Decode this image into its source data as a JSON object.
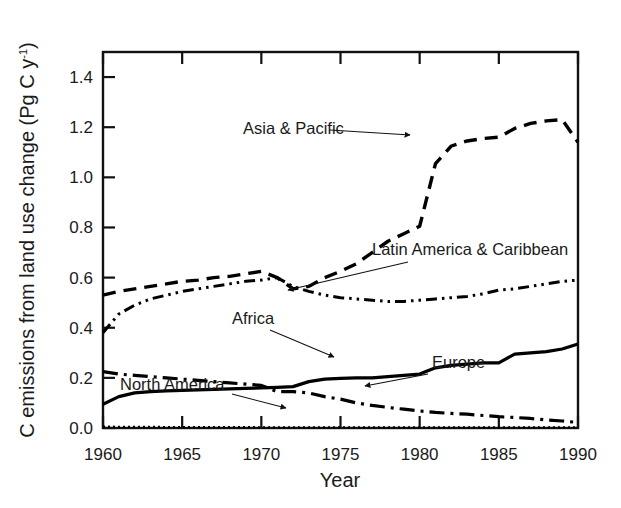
{
  "chart_data": {
    "type": "line",
    "title": "",
    "xlabel": "Year",
    "ylabel": "C emissions from land use change (Pg C y-1)",
    "ylabel_parts": {
      "main": "C emissions from land use change (Pg C y",
      "superscript": "-1",
      "tail": ")"
    },
    "xlim": [
      1960,
      1990
    ],
    "ylim": [
      0.0,
      1.5
    ],
    "grid": false,
    "legend_position": "inline-annotations",
    "xticks": [
      1960,
      1965,
      1970,
      1975,
      1980,
      1985,
      1990
    ],
    "xticklabels": [
      "1960",
      "1965",
      "1970",
      "1975",
      "1980",
      "1985",
      "1990"
    ],
    "yticks": [
      0.0,
      0.2,
      0.4,
      0.6,
      0.8,
      1.0,
      1.2,
      1.4
    ],
    "yticklabels": [
      "0.0",
      "0.2",
      "0.4",
      "0.6",
      "0.8",
      "1.0",
      "1.2",
      "1.4"
    ],
    "x": [
      1960,
      1961,
      1962,
      1963,
      1964,
      1965,
      1966,
      1967,
      1968,
      1969,
      1970,
      1971,
      1972,
      1973,
      1974,
      1975,
      1976,
      1977,
      1978,
      1979,
      1980,
      1981,
      1982,
      1983,
      1984,
      1985,
      1986,
      1987,
      1988,
      1989,
      1990
    ],
    "series": [
      {
        "name": "Asia & Pacific",
        "linestyle": "dashed",
        "color": "#000000",
        "values": [
          0.53,
          0.545,
          0.555,
          0.565,
          0.575,
          0.585,
          0.59,
          0.6,
          0.605,
          0.615,
          0.625,
          0.6,
          0.555,
          0.565,
          0.6,
          0.625,
          0.655,
          0.7,
          0.745,
          0.775,
          0.805,
          1.055,
          1.125,
          1.145,
          1.155,
          1.16,
          1.195,
          1.215,
          1.225,
          1.23,
          1.14
        ]
      },
      {
        "name": "Latin America &  Caribbean",
        "linestyle": "dashdotdot",
        "color": "#000000",
        "values": [
          0.38,
          0.455,
          0.49,
          0.515,
          0.53,
          0.545,
          0.555,
          0.565,
          0.575,
          0.585,
          0.59,
          0.6,
          0.565,
          0.545,
          0.53,
          0.52,
          0.515,
          0.51,
          0.505,
          0.505,
          0.51,
          0.515,
          0.52,
          0.525,
          0.535,
          0.55,
          0.555,
          0.565,
          0.575,
          0.585,
          0.59
        ]
      },
      {
        "name": "Africa",
        "linestyle": "solid",
        "color": "#000000",
        "values": [
          0.095,
          0.125,
          0.14,
          0.145,
          0.148,
          0.15,
          0.152,
          0.154,
          0.156,
          0.158,
          0.16,
          0.162,
          0.165,
          0.185,
          0.195,
          0.198,
          0.2,
          0.2,
          0.205,
          0.21,
          0.215,
          0.24,
          0.25,
          0.255,
          0.26,
          0.26,
          0.295,
          0.3,
          0.305,
          0.315,
          0.335
        ]
      },
      {
        "name": "Europe",
        "linestyle": "dashdot",
        "color": "#000000",
        "values": [
          0.225,
          0.215,
          0.21,
          0.205,
          0.2,
          0.195,
          0.19,
          0.185,
          0.18,
          0.175,
          0.17,
          0.145,
          0.145,
          0.14,
          0.125,
          0.115,
          0.1,
          0.09,
          0.082,
          0.075,
          0.068,
          0.062,
          0.058,
          0.055,
          0.05,
          0.045,
          0.042,
          0.038,
          0.032,
          0.028,
          0.022
        ]
      },
      {
        "name": "North America",
        "linestyle": "dotted",
        "color": "#000000",
        "values": [
          0.005,
          0.004,
          0.004,
          0.004,
          0.003,
          0.003,
          0.003,
          0.003,
          0.003,
          0.003,
          0.002,
          0.002,
          0.002,
          0.002,
          0.002,
          0.002,
          0.002,
          0.002,
          0.002,
          0.002,
          0.002,
          0.002,
          0.002,
          0.002,
          0.002,
          0.002,
          0.002,
          0.002,
          0.002,
          0.002,
          0.002
        ]
      }
    ],
    "annotations": [
      {
        "text": "Asia & Pacific",
        "label_x": 243,
        "label_y": 134,
        "leader_from": [
          330,
          130
        ],
        "leader_to": [
          410,
          135
        ]
      },
      {
        "text": "Latin America &  Caribbean",
        "label_x": 372,
        "label_y": 255,
        "leader_from": [
          408,
          262
        ],
        "leader_to": [
          288,
          290
        ]
      },
      {
        "text": "Africa",
        "label_x": 232,
        "label_y": 324,
        "leader_from": [
          270,
          330
        ],
        "leader_to": [
          334,
          357
        ]
      },
      {
        "text": "Europe",
        "label_x": 432,
        "label_y": 368,
        "leader_from": [
          428,
          374
        ],
        "leader_to": [
          365,
          386
        ]
      },
      {
        "text": "North America",
        "label_x": 120,
        "label_y": 390,
        "leader_from": [
          232,
          394
        ],
        "leader_to": [
          286,
          408
        ]
      }
    ]
  }
}
